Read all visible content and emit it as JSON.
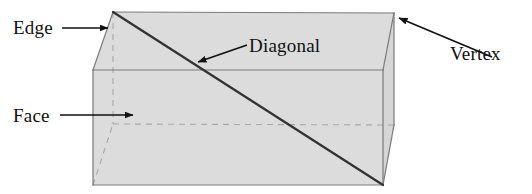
{
  "figure": {
    "background_color": "#ffffff",
    "face_fill_color": "#dcdcdc",
    "outline_color": "#7a7a7a",
    "diagonal_color": "#333333",
    "hidden_edge_color": "#a8a8a8",
    "label_color": "#111111",
    "shape_type": "rectangular prism"
  },
  "labels": {
    "edge": "Edge",
    "face": "Face",
    "diagonal": "Diagonal",
    "vertex": "Vertex"
  },
  "geometry": {
    "front_top_left": [
      93,
      70
    ],
    "front_top_right": [
      383,
      70
    ],
    "front_bottom_left": [
      93,
      185
    ],
    "front_bottom_right": [
      383,
      185
    ],
    "back_top_left": [
      113,
      12
    ],
    "back_top_right": [
      394,
      13
    ],
    "back_bottom_left": [
      113,
      124
    ],
    "back_bottom_right": [
      394,
      125
    ],
    "diagonal_start": [
      113,
      12
    ],
    "diagonal_end": [
      383,
      185
    ]
  },
  "annotations": {
    "edge_arrow": {
      "from": [
        62,
        28
      ],
      "to": [
        108,
        28
      ]
    },
    "face_arrow": {
      "from": [
        60,
        115
      ],
      "to": [
        133,
        115
      ]
    },
    "diagonal_arrow": {
      "from": [
        247,
        45
      ],
      "to": [
        196,
        63
      ]
    },
    "vertex_arrow": {
      "from": [
        492,
        57
      ],
      "to": [
        398,
        17
      ]
    }
  }
}
